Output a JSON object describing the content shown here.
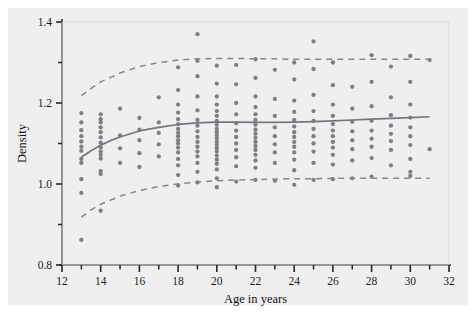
{
  "chart_data": {
    "type": "scatter",
    "title": "",
    "xlabel": "Age in years",
    "ylabel": "Density",
    "xlim": [
      12,
      32
    ],
    "ylim": [
      0.8,
      1.4
    ],
    "grid": false,
    "legend": "none",
    "xticks_major": [
      12,
      14,
      16,
      18,
      20,
      22,
      24,
      26,
      28,
      30,
      32
    ],
    "xticks_minor": [
      13,
      15,
      17,
      19,
      21,
      23,
      25,
      27,
      29,
      31
    ],
    "xtick_labels": [
      "12",
      "14",
      "16",
      "18",
      "20",
      "22",
      "24",
      "26",
      "28",
      "30",
      "32"
    ],
    "yticks_major": [
      0.8,
      1.0,
      1.2,
      1.4
    ],
    "yticks_minor": [
      0.9,
      1.1,
      1.3
    ],
    "ytick_labels": [
      "0.8",
      "1.0",
      "1.2",
      "1.4"
    ],
    "colors": {
      "point": "#7c7f86",
      "fit_line": "#74777e",
      "band_line": "#84878e",
      "axis": "#262626",
      "panel_bg": "#efefef",
      "figure_bg": "#ffffff"
    },
    "series": [
      {
        "name": "Observations",
        "marker": "filled-circle",
        "points": [
          [
            13,
            0.862
          ],
          [
            13,
            0.978
          ],
          [
            13,
            1.012
          ],
          [
            13,
            1.052
          ],
          [
            13,
            1.062
          ],
          [
            13,
            1.082
          ],
          [
            13,
            1.092
          ],
          [
            13,
            1.105
          ],
          [
            13,
            1.118
          ],
          [
            13,
            1.133
          ],
          [
            13,
            1.152
          ],
          [
            13,
            1.175
          ],
          [
            14,
            0.934
          ],
          [
            14,
            1.025
          ],
          [
            14,
            1.032
          ],
          [
            14,
            1.063
          ],
          [
            14,
            1.072
          ],
          [
            14,
            1.08
          ],
          [
            14,
            1.09
          ],
          [
            14,
            1.102
          ],
          [
            14,
            1.115
          ],
          [
            14,
            1.128
          ],
          [
            14,
            1.14
          ],
          [
            14,
            1.152
          ],
          [
            14,
            1.16
          ],
          [
            14,
            1.172
          ],
          [
            15,
            1.052
          ],
          [
            15,
            1.088
          ],
          [
            15,
            1.12
          ],
          [
            15,
            1.186
          ],
          [
            16,
            1.042
          ],
          [
            16,
            1.076
          ],
          [
            16,
            1.108
          ],
          [
            16,
            1.134
          ],
          [
            16,
            1.163
          ],
          [
            17,
            1.068
          ],
          [
            17,
            1.098
          ],
          [
            17,
            1.126
          ],
          [
            17,
            1.152
          ],
          [
            17,
            1.214
          ],
          [
            18,
            0.996
          ],
          [
            18,
            1.022
          ],
          [
            18,
            1.046
          ],
          [
            18,
            1.062
          ],
          [
            18,
            1.078
          ],
          [
            18,
            1.09
          ],
          [
            18,
            1.1
          ],
          [
            18,
            1.108
          ],
          [
            18,
            1.118
          ],
          [
            18,
            1.126
          ],
          [
            18,
            1.136
          ],
          [
            18,
            1.148
          ],
          [
            18,
            1.16
          ],
          [
            18,
            1.176
          ],
          [
            18,
            1.196
          ],
          [
            18,
            1.232
          ],
          [
            18,
            1.288
          ],
          [
            19,
            1.004
          ],
          [
            19,
            1.03
          ],
          [
            19,
            1.052
          ],
          [
            19,
            1.068
          ],
          [
            19,
            1.08
          ],
          [
            19,
            1.092
          ],
          [
            19,
            1.104
          ],
          [
            19,
            1.116
          ],
          [
            19,
            1.13
          ],
          [
            19,
            1.144
          ],
          [
            19,
            1.158
          ],
          [
            19,
            1.182
          ],
          [
            19,
            1.216
          ],
          [
            19,
            1.266
          ],
          [
            19,
            1.304
          ],
          [
            19,
            1.37
          ],
          [
            20,
            0.992
          ],
          [
            20,
            1.014
          ],
          [
            20,
            1.036
          ],
          [
            20,
            1.05
          ],
          [
            20,
            1.06
          ],
          [
            20,
            1.07
          ],
          [
            20,
            1.08
          ],
          [
            20,
            1.088
          ],
          [
            20,
            1.096
          ],
          [
            20,
            1.104
          ],
          [
            20,
            1.112
          ],
          [
            20,
            1.12
          ],
          [
            20,
            1.128
          ],
          [
            20,
            1.136
          ],
          [
            20,
            1.146
          ],
          [
            20,
            1.156
          ],
          [
            20,
            1.168
          ],
          [
            20,
            1.18
          ],
          [
            20,
            1.196
          ],
          [
            20,
            1.216
          ],
          [
            20,
            1.248
          ],
          [
            20,
            1.292
          ],
          [
            21,
            1.006
          ],
          [
            21,
            1.044
          ],
          [
            21,
            1.066
          ],
          [
            21,
            1.084
          ],
          [
            21,
            1.1
          ],
          [
            21,
            1.116
          ],
          [
            21,
            1.132
          ],
          [
            21,
            1.15
          ],
          [
            21,
            1.172
          ],
          [
            21,
            1.2
          ],
          [
            21,
            1.246
          ],
          [
            21,
            1.294
          ],
          [
            22,
            1.01
          ],
          [
            22,
            1.04
          ],
          [
            22,
            1.058
          ],
          [
            22,
            1.072
          ],
          [
            22,
            1.084
          ],
          [
            22,
            1.094
          ],
          [
            22,
            1.104
          ],
          [
            22,
            1.114
          ],
          [
            22,
            1.124
          ],
          [
            22,
            1.134
          ],
          [
            22,
            1.146
          ],
          [
            22,
            1.158
          ],
          [
            22,
            1.172
          ],
          [
            22,
            1.19
          ],
          [
            22,
            1.216
          ],
          [
            22,
            1.262
          ],
          [
            22,
            1.308
          ],
          [
            23,
            1.008
          ],
          [
            23,
            1.052
          ],
          [
            23,
            1.078
          ],
          [
            23,
            1.098
          ],
          [
            23,
            1.118
          ],
          [
            23,
            1.14
          ],
          [
            23,
            1.168
          ],
          [
            23,
            1.21
          ],
          [
            23,
            1.282
          ],
          [
            24,
            0.998
          ],
          [
            24,
            1.034
          ],
          [
            24,
            1.06
          ],
          [
            24,
            1.078
          ],
          [
            24,
            1.092
          ],
          [
            24,
            1.104
          ],
          [
            24,
            1.116
          ],
          [
            24,
            1.128
          ],
          [
            24,
            1.142
          ],
          [
            24,
            1.158
          ],
          [
            24,
            1.178
          ],
          [
            24,
            1.206
          ],
          [
            24,
            1.258
          ],
          [
            24,
            1.3
          ],
          [
            25,
            1.01
          ],
          [
            25,
            1.052
          ],
          [
            25,
            1.08
          ],
          [
            25,
            1.1
          ],
          [
            25,
            1.118
          ],
          [
            25,
            1.136
          ],
          [
            25,
            1.156
          ],
          [
            25,
            1.18
          ],
          [
            25,
            1.22
          ],
          [
            25,
            1.284
          ],
          [
            25,
            1.352
          ],
          [
            26,
            1.012
          ],
          [
            26,
            1.048
          ],
          [
            26,
            1.072
          ],
          [
            26,
            1.09
          ],
          [
            26,
            1.104
          ],
          [
            26,
            1.118
          ],
          [
            26,
            1.132
          ],
          [
            26,
            1.148
          ],
          [
            26,
            1.168
          ],
          [
            26,
            1.196
          ],
          [
            26,
            1.244
          ],
          [
            26,
            1.3
          ],
          [
            27,
            1.014
          ],
          [
            27,
            1.058
          ],
          [
            27,
            1.086
          ],
          [
            27,
            1.108
          ],
          [
            27,
            1.13
          ],
          [
            27,
            1.154
          ],
          [
            27,
            1.186
          ],
          [
            27,
            1.24
          ],
          [
            28,
            1.018
          ],
          [
            28,
            1.064
          ],
          [
            28,
            1.092
          ],
          [
            28,
            1.112
          ],
          [
            28,
            1.132
          ],
          [
            28,
            1.156
          ],
          [
            28,
            1.192
          ],
          [
            28,
            1.252
          ],
          [
            28,
            1.318
          ],
          [
            29,
            1.046
          ],
          [
            29,
            1.084
          ],
          [
            29,
            1.106
          ],
          [
            29,
            1.124
          ],
          [
            29,
            1.144
          ],
          [
            29,
            1.17
          ],
          [
            29,
            1.214
          ],
          [
            29,
            1.29
          ],
          [
            30,
            1.02
          ],
          [
            30,
            1.03
          ],
          [
            30,
            1.062
          ],
          [
            30,
            1.096
          ],
          [
            30,
            1.118
          ],
          [
            30,
            1.14
          ],
          [
            30,
            1.164
          ],
          [
            30,
            1.196
          ],
          [
            30,
            1.252
          ],
          [
            30,
            1.316
          ],
          [
            31,
            1.086
          ],
          [
            31,
            1.306
          ]
        ]
      }
    ],
    "fit_curve": {
      "name": "Fitted mean",
      "style": "solid",
      "x": [
        13,
        13.5,
        14,
        14.5,
        15,
        16,
        17,
        18,
        19,
        20,
        21,
        22,
        23,
        24,
        25,
        26,
        27,
        28,
        29,
        30,
        31
      ],
      "y": [
        1.066,
        1.082,
        1.096,
        1.107,
        1.116,
        1.131,
        1.14,
        1.147,
        1.151,
        1.153,
        1.153,
        1.152,
        1.152,
        1.153,
        1.154,
        1.156,
        1.158,
        1.16,
        1.162,
        1.164,
        1.166
      ]
    },
    "bands": [
      {
        "name": "Upper reference limit",
        "style": "dashed",
        "x": [
          13,
          13.5,
          14,
          15,
          16,
          17,
          18,
          19,
          20,
          21,
          22,
          23,
          24,
          25,
          26,
          27,
          28,
          29,
          30,
          31
        ],
        "y": [
          1.218,
          1.236,
          1.252,
          1.274,
          1.29,
          1.3,
          1.306,
          1.309,
          1.31,
          1.31,
          1.309,
          1.309,
          1.308,
          1.308,
          1.308,
          1.308,
          1.308,
          1.308,
          1.308,
          1.308
        ]
      },
      {
        "name": "Lower reference limit",
        "style": "dashed",
        "x": [
          13,
          13.5,
          14,
          15,
          16,
          17,
          18,
          19,
          20,
          21,
          22,
          23,
          24,
          25,
          26,
          27,
          28,
          29,
          30,
          31
        ],
        "y": [
          0.918,
          0.936,
          0.95,
          0.97,
          0.984,
          0.994,
          1.0,
          1.005,
          1.008,
          1.01,
          1.011,
          1.012,
          1.013,
          1.013,
          1.014,
          1.014,
          1.014,
          1.014,
          1.014,
          1.014
        ]
      }
    ]
  }
}
